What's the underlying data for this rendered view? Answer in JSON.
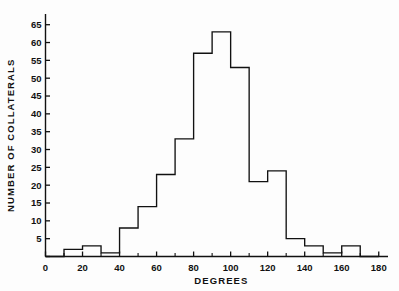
{
  "figure": {
    "background_color": "#fdfdfd",
    "line_color": "#111111"
  },
  "chart_data": {
    "type": "bar",
    "title": "",
    "subtitle": "",
    "xlabel": "DEGREES",
    "ylabel": "NUMBER OF COLLATERALS",
    "xlim": [
      0,
      185
    ],
    "ylim": [
      0,
      68
    ],
    "grid": false,
    "legend": null,
    "bin_width": 10,
    "bin_edges": [
      0,
      10,
      20,
      30,
      40,
      50,
      60,
      70,
      80,
      90,
      100,
      110,
      120,
      130,
      140,
      150,
      160,
      170,
      180
    ],
    "categories": [
      "0-10",
      "10-20",
      "20-30",
      "30-40",
      "40-50",
      "50-60",
      "60-70",
      "70-80",
      "80-90",
      "90-100",
      "100-110",
      "110-120",
      "120-130",
      "130-140",
      "140-150",
      "150-160",
      "160-170",
      "170-180"
    ],
    "values": [
      0,
      2,
      3,
      1,
      8,
      14,
      23,
      33,
      57,
      63,
      53,
      21,
      24,
      5,
      3,
      1,
      3,
      0
    ],
    "x_ticks_major": [
      0,
      20,
      40,
      60,
      80,
      100,
      120,
      140,
      160,
      180
    ],
    "x_tick_labels": [
      "0",
      "20",
      "40",
      "60",
      "80",
      "100",
      "120",
      "140",
      "160",
      "180"
    ],
    "x_ticks_minor": [
      10,
      30,
      50,
      70,
      90,
      110,
      130,
      150,
      170
    ],
    "y_ticks_major": [
      0,
      5,
      10,
      15,
      20,
      25,
      30,
      35,
      40,
      45,
      50,
      55,
      60,
      65
    ],
    "y_tick_labels": [
      "",
      "5",
      "10",
      "15",
      "20",
      "25",
      "30",
      "35",
      "40",
      "45",
      "50",
      "55",
      "60",
      "65"
    ],
    "y_axis_zero_label": "0",
    "annotations": []
  }
}
